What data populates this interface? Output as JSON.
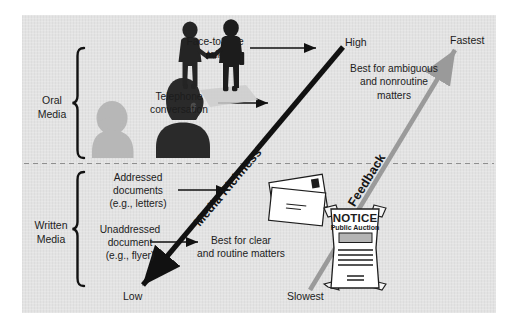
{
  "figure": {
    "background_color": "#e3e3e3",
    "page_color": "#ffffff"
  },
  "groups": {
    "oral": {
      "label": "Oral\nMedia",
      "label_line1": "Oral",
      "label_line2": "Media"
    },
    "written": {
      "label": "Written\nMedia",
      "label_line1": "Written",
      "label_line2": "Media"
    }
  },
  "axes": {
    "richness": {
      "name": "Media Richness",
      "low_label": "Low",
      "high_label": "High",
      "color": "#111111"
    },
    "feedback": {
      "name": "Feedback",
      "low_label": "Slowest",
      "high_label": "Fastest",
      "color": "#9a9a9a"
    }
  },
  "callouts": [
    {
      "id": "face-to-face",
      "text": "Face-to-face\ntalk",
      "line1": "Face-to-face",
      "line2": "talk"
    },
    {
      "id": "telephone",
      "text": "Telephone\nconversation",
      "line1": "Telephone",
      "line2": "conversation"
    },
    {
      "id": "addressed-documents",
      "text": "Addressed\ndocuments\n(e.g., letters)",
      "line1": "Addressed",
      "line2": "documents",
      "line3": "(e.g., letters)"
    },
    {
      "id": "unaddressed-document",
      "text": "Unaddressed\ndocument\n(e.g., flyer)",
      "line1": "Unaddressed",
      "line2": "document",
      "line3": "(e.g., flyer)"
    }
  ],
  "annotations": {
    "top": {
      "line1": "Best for ambiguous",
      "line2": "and nonroutine",
      "line3": "matters"
    },
    "bottom": {
      "line1": "Best for clear",
      "line2": "and routine matters"
    }
  },
  "notice_poster": {
    "title": "NOTICE",
    "subtitle": "Public Auction"
  },
  "icons": {
    "handshake": "handshake-silhouette-icon",
    "phone_person": "person-on-phone-silhouette-icon",
    "listener_person": "person-listening-silhouette-icon",
    "envelopes": "stacked-envelopes-icon",
    "poster": "notice-poster-icon",
    "divider": "dashed-divider-icon"
  }
}
